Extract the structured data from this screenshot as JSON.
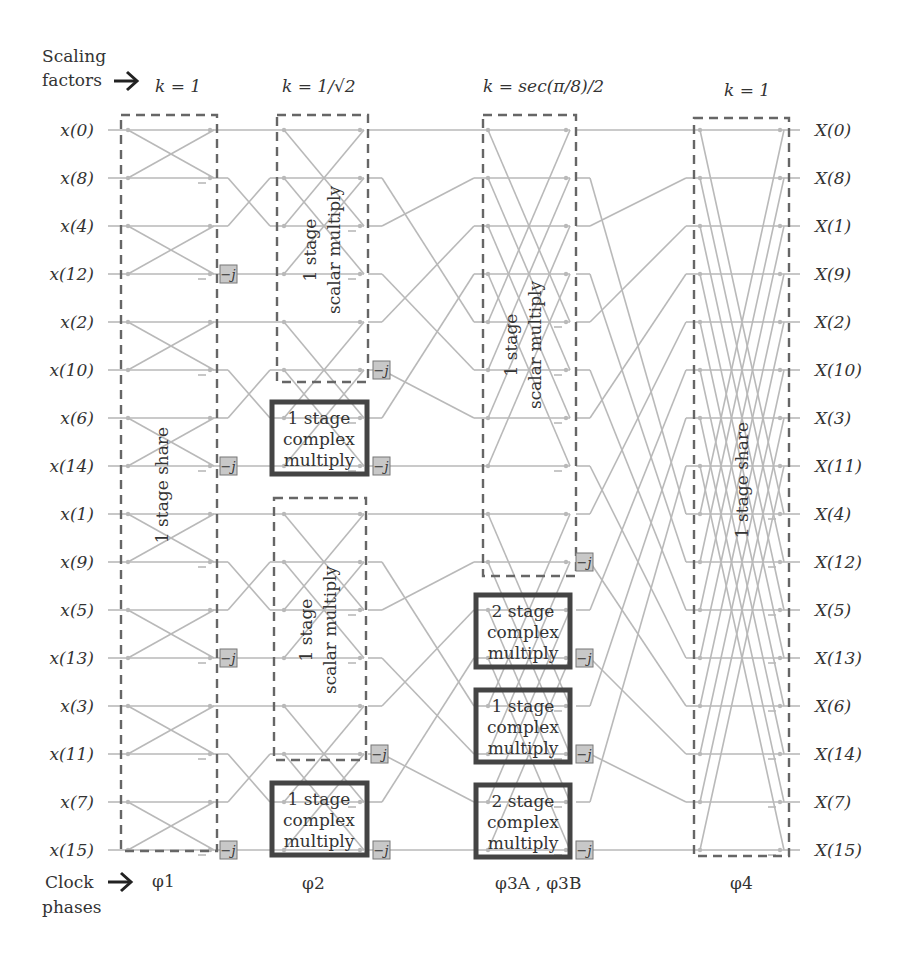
{
  "header": {
    "scaling_label_line1": "Scaling",
    "scaling_label_line2": "factors",
    "clock_label_line1": "Clock",
    "clock_label_line2": "phases",
    "arrow": "→"
  },
  "stages": [
    {
      "id": "stage1",
      "k": "k = 1",
      "phase": "φ1",
      "box_label": "1 stage share"
    },
    {
      "id": "stage2",
      "k": "k = 1/√2",
      "phase": "φ2",
      "box_labels": [
        "1 stage scalar multiply",
        "1 stage complex multiply",
        "1 stage scalar multiply",
        "1 stage complex multiply"
      ]
    },
    {
      "id": "stage3",
      "k": "k = sec(π/8)/2",
      "phase": "φ3A , φ3B",
      "box_labels": [
        "1 stage scalar multiply",
        "2 stage complex multiply",
        "1 stage complex multiply",
        "2 stage complex multiply"
      ]
    },
    {
      "id": "stage4",
      "k": "k = 1",
      "phase": "φ4",
      "box_label": "1 stage share"
    }
  ],
  "inputs": [
    "x(0)",
    "x(8)",
    "x(4)",
    "x(12)",
    "x(2)",
    "x(10)",
    "x(6)",
    "x(14)",
    "x(1)",
    "x(9)",
    "x(5)",
    "x(13)",
    "x(3)",
    "x(11)",
    "x(7)",
    "x(15)"
  ],
  "outputs": [
    "X(0)",
    "X(8)",
    "X(1)",
    "X(9)",
    "X(2)",
    "X(10)",
    "X(3)",
    "X(11)",
    "X(4)",
    "X(12)",
    "X(5)",
    "X(13)",
    "X(6)",
    "X(14)",
    "X(7)",
    "X(15)"
  ],
  "twiddle_label": "−j",
  "box_text": {
    "share": "1 stage share",
    "scalar_line1": "1 stage",
    "scalar_line2": "scalar multiply",
    "c1_line1": "1 stage",
    "c2_line1": "2 stage",
    "complex": "complex",
    "multiply": "multiply"
  },
  "colors": {
    "wire": "#b9b9b9",
    "dashed_box": "#666666",
    "solid_box": "#444444",
    "twiddle_fill": "#c8c8c8",
    "text": "#333333"
  }
}
